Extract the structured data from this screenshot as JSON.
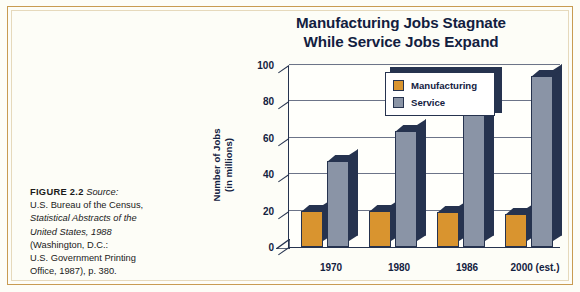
{
  "figure": {
    "label": "FIGURE 2.2",
    "source_word": "Source:",
    "source_lines": [
      "U.S. Bureau of the Census,",
      "Statistical Abstracts of the",
      "United States, 1988",
      "(Washington, D.C.:",
      "U.S. Government Printing",
      "Office, 1987), p. 380."
    ]
  },
  "title": {
    "line1": "Manufacturing Jobs Stagnate",
    "line2": "While Service Jobs Expand"
  },
  "legend": {
    "items": [
      {
        "label": "Manufacturing",
        "color": "#d9942f"
      },
      {
        "label": "Service",
        "color": "#8a94a6"
      }
    ]
  },
  "colors": {
    "manufacturing": "#d9942f",
    "service": "#8a94a6",
    "depth": "#26334f",
    "page_background": "#fdfdf7",
    "frame_rule": "#c89b52",
    "text": "#13213f"
  },
  "chart_data": {
    "type": "bar",
    "title": "Manufacturing Jobs Stagnate While Service Jobs Expand",
    "xlabel": "",
    "ylabel": "Number of Jobs (in millions)",
    "ylabel_line1": "Number of Jobs",
    "ylabel_line2": "(in millions)",
    "categories": [
      "1970",
      "1980",
      "1986",
      "2000 (est.)"
    ],
    "series": [
      {
        "name": "Manufacturing",
        "color": "#d9942f",
        "values": [
          20,
          20,
          19,
          18
        ]
      },
      {
        "name": "Service",
        "color": "#8a94a6",
        "values": [
          47,
          64,
          73,
          94
        ]
      }
    ],
    "ylim": [
      0,
      100
    ],
    "yticks": [
      0,
      20,
      40,
      60,
      80,
      100
    ],
    "ytick_labels": [
      "0",
      "20",
      "40",
      "60",
      "80",
      "100"
    ],
    "grid": true,
    "legend_position": "top-left-inside",
    "style": "3d-column"
  }
}
